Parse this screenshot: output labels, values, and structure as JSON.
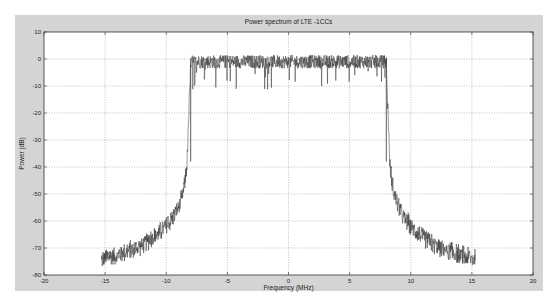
{
  "chart_data": {
    "type": "line",
    "title": "Power spectrum of LTE -1CCs",
    "xlabel": "Frequency (MHz)",
    "ylabel": "Power (dB)",
    "xlim": [
      -20,
      20
    ],
    "ylim": [
      -80,
      10
    ],
    "xticks": [
      -20,
      -15,
      -10,
      -5,
      0,
      5,
      10,
      15,
      20
    ],
    "yticks": [
      10,
      0,
      -10,
      -20,
      -30,
      -40,
      -50,
      -60,
      -70,
      -80
    ],
    "xtick_labels": [
      "-20",
      "-15",
      "-10",
      "-5",
      "0",
      "5",
      "10",
      "15",
      "20"
    ],
    "ytick_labels": [
      "10",
      "0",
      "-10",
      "-20",
      "-30",
      "-40",
      "-50",
      "-60",
      "-70",
      "-80"
    ],
    "grid": true,
    "series": [
      {
        "name": "LTE 1CC spectrum",
        "color": "#333333",
        "description": "Noisy flat in-band power near 0 dB from about -8 to 8 MHz, steep skirts falling to about -72 dB at +/-15.3 MHz",
        "envelope": {
          "x": [
            -15.3,
            -14,
            -13,
            -12,
            -11,
            -10,
            -9.5,
            -9,
            -8.7,
            -8.5,
            -8.3,
            -8.0,
            0,
            8.0,
            8.3,
            8.5,
            8.7,
            9,
            9.5,
            10,
            11,
            12,
            13,
            14,
            15.3
          ],
          "y": [
            -73,
            -71.5,
            -70,
            -68,
            -65,
            -61,
            -58,
            -54,
            -50,
            -45,
            -38,
            -1,
            -1,
            -1,
            -38,
            -45,
            -50,
            -54,
            -58,
            -61,
            -65,
            -68,
            -70,
            -71.5,
            -73
          ]
        },
        "inband_noise_db": 2.5,
        "skirt_noise_db": 3
      }
    ]
  }
}
